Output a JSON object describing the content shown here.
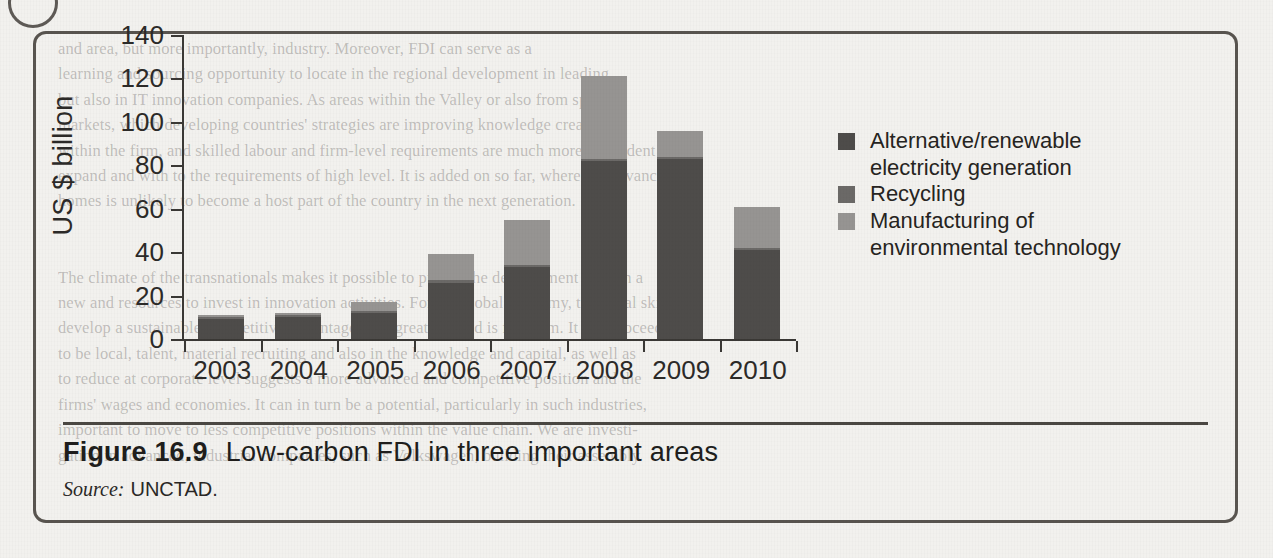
{
  "figure": {
    "caption_number": "Figure 16.9",
    "caption_text": "Low-carbon FDI in three important areas",
    "source_label": "Source:",
    "source_value": "UNCTAD."
  },
  "legend": {
    "items": [
      {
        "label_line1": "Alternative/renewable",
        "label_line2": "electricity generation",
        "color": "#4e4c4a",
        "name": "alternative-renewable-electricity-generation"
      },
      {
        "label_line1": "Recycling",
        "label_line2": "",
        "color": "#6b6967",
        "name": "recycling"
      },
      {
        "label_line1": "Manufacturing of",
        "label_line2": "environmental technology",
        "color": "#969492",
        "name": "manufacturing-of-environmental-technology"
      }
    ]
  },
  "page_bleed_text": "and area, but more importantly, industry. Moreover, FDI can serve as a\nlearning and sourcing opportunity to locate in the regional development in leading\nbut also in IT innovation companies. As areas within the Valley or also from specific\nmarkets, which developing countries' strategies are improving knowledge creation\nwithin the firm, and skilled labour and firm-level requirements are much more dependent to\nexpand and with to the requirements of high level. It is added on so far, where the advanced\nhomes is unlikely to become a host part of the country in the next generation.\n\n\nThe climate of the transnationals makes it possible to pursue the development of such a\nnew and resources to invest in innovation activities. For the global economy, technical skills to\ndevelop a sustainable competitive advantage. The greatest need is for them. It can proceed\nto be local, talent, material recruiting and also in the knowledge and capital, as well as\nto reduce at corporate level suggests a more advanced and competitive position and the\nfirms' wages and economies. It can in turn be a potential, particularly in such industries,\nimportant to move to less competitive positions within the value chain. We are investi-\ngating in advanced, industrial companies, such as Volkswagen, building their assembly",
  "chart_data": {
    "type": "bar",
    "bar_mode": "stacked",
    "title": "",
    "xlabel": "",
    "ylabel": "US $ billion",
    "ylim": [
      0,
      140
    ],
    "yticks": [
      0,
      20,
      40,
      60,
      80,
      100,
      120,
      140
    ],
    "grid": false,
    "legend_position": "right",
    "categories": [
      "2003",
      "2004",
      "2005",
      "2006",
      "2007",
      "2008",
      "2009",
      "2010"
    ],
    "series": [
      {
        "name": "Alternative/renewable electricity generation",
        "color": "#4e4c4a",
        "values": [
          9,
          10,
          12,
          26,
          33,
          82,
          83,
          41
        ]
      },
      {
        "name": "Recycling",
        "color": "#6b6967",
        "values": [
          1,
          1,
          1,
          1,
          1,
          1,
          1,
          1
        ]
      },
      {
        "name": "Manufacturing of environmental technology",
        "color": "#969492",
        "values": [
          1,
          1,
          4,
          12,
          21,
          38,
          12,
          19
        ]
      }
    ],
    "totals": [
      11,
      12,
      17,
      39,
      55,
      121,
      96,
      61
    ]
  }
}
